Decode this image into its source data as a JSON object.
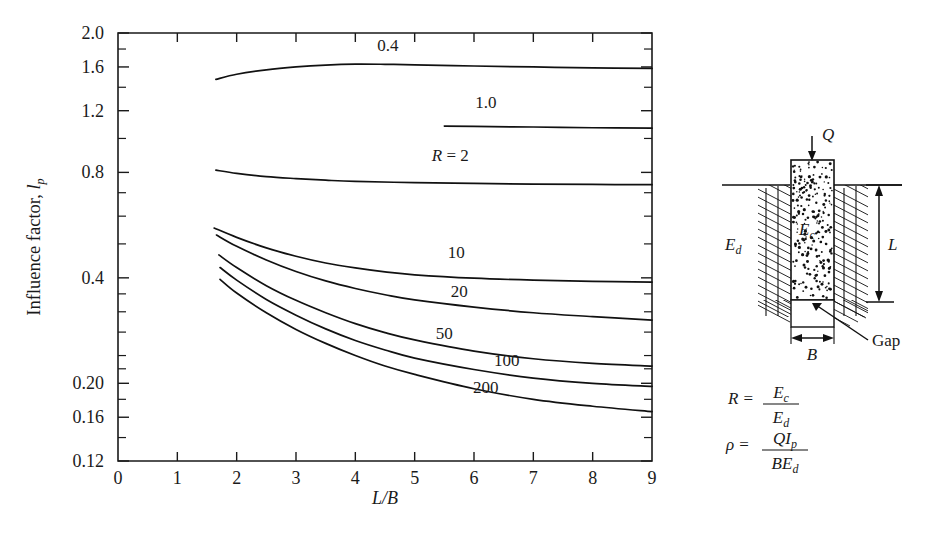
{
  "chart_data": {
    "type": "line",
    "title": "",
    "xlabel": "L/B",
    "ylabel": "Influence factor, Ip",
    "yscale": "log",
    "xlim": [
      0,
      9
    ],
    "ylim": [
      0.12,
      2.0
    ],
    "grid": false,
    "legend_position": "inline-curve-labels",
    "xticks": [
      "0",
      "1",
      "2",
      "3",
      "4",
      "5",
      "6",
      "7",
      "8",
      "9"
    ],
    "xtick_values": [
      0,
      1,
      2,
      3,
      4,
      5,
      6,
      7,
      8,
      9
    ],
    "yticks": [
      "2.0",
      "1.6",
      "1.2",
      "0.8",
      "0.4",
      "0.20",
      "0.16",
      "0.12"
    ],
    "ytick_values": [
      2.0,
      1.6,
      1.2,
      0.8,
      0.4,
      0.2,
      0.16,
      0.12
    ],
    "yticks_minor": [
      1.8,
      1.4,
      1.0,
      0.7,
      0.6,
      0.5,
      0.36,
      0.32,
      0.28,
      0.24,
      0.22,
      0.18,
      0.14
    ],
    "series": [
      {
        "name": "0.4",
        "label": "0.4",
        "label_x": 4.55,
        "label_y": 1.78,
        "points": [
          [
            1.65,
            1.475
          ],
          [
            2.0,
            1.525
          ],
          [
            2.5,
            1.57
          ],
          [
            3.0,
            1.6
          ],
          [
            3.5,
            1.62
          ],
          [
            4.0,
            1.63
          ],
          [
            4.5,
            1.628
          ],
          [
            5.0,
            1.622
          ],
          [
            6.0,
            1.61
          ],
          [
            7.0,
            1.6
          ],
          [
            8.0,
            1.59
          ],
          [
            9.0,
            1.585
          ]
        ]
      },
      {
        "name": "1.0",
        "label": "1.0",
        "label_x": 6.2,
        "label_y": 1.22,
        "points": [
          [
            5.5,
            1.085
          ],
          [
            6.0,
            1.082
          ],
          [
            7.0,
            1.078
          ],
          [
            8.0,
            1.073
          ],
          [
            9.0,
            1.07
          ]
        ]
      },
      {
        "name": "R = 2",
        "label": "R = 2",
        "label_x": 5.6,
        "label_y": 0.86,
        "points": [
          [
            1.65,
            0.812
          ],
          [
            2.0,
            0.795
          ],
          [
            2.5,
            0.778
          ],
          [
            3.0,
            0.768
          ],
          [
            3.5,
            0.76
          ],
          [
            4.0,
            0.754
          ],
          [
            5.0,
            0.748
          ],
          [
            6.0,
            0.744
          ],
          [
            7.0,
            0.741
          ],
          [
            8.0,
            0.739
          ],
          [
            9.0,
            0.738
          ]
        ]
      },
      {
        "name": "10",
        "label": "10",
        "label_x": 5.7,
        "label_y": 0.455,
        "points": [
          [
            1.62,
            0.555
          ],
          [
            2.0,
            0.522
          ],
          [
            2.5,
            0.487
          ],
          [
            3.0,
            0.461
          ],
          [
            3.5,
            0.441
          ],
          [
            4.0,
            0.427
          ],
          [
            4.5,
            0.416
          ],
          [
            5.0,
            0.408
          ],
          [
            6.0,
            0.399
          ],
          [
            7.0,
            0.394
          ],
          [
            8.0,
            0.391
          ],
          [
            9.0,
            0.389
          ]
        ]
      },
      {
        "name": "20",
        "label": "20",
        "label_x": 5.75,
        "label_y": 0.352,
        "points": [
          [
            1.66,
            0.53
          ],
          [
            2.0,
            0.492
          ],
          [
            2.5,
            0.45
          ],
          [
            3.0,
            0.417
          ],
          [
            3.5,
            0.392
          ],
          [
            4.0,
            0.373
          ],
          [
            4.5,
            0.358
          ],
          [
            5.0,
            0.346
          ],
          [
            6.0,
            0.33
          ],
          [
            7.0,
            0.318
          ],
          [
            8.0,
            0.31
          ],
          [
            9.0,
            0.303
          ]
        ]
      },
      {
        "name": "50",
        "label": "50",
        "label_x": 5.5,
        "label_y": 0.268,
        "points": [
          [
            1.7,
            0.465
          ],
          [
            2.0,
            0.428
          ],
          [
            2.5,
            0.38
          ],
          [
            3.0,
            0.345
          ],
          [
            3.5,
            0.318
          ],
          [
            4.0,
            0.296
          ],
          [
            4.5,
            0.279
          ],
          [
            5.0,
            0.266
          ],
          [
            6.0,
            0.247
          ],
          [
            7.0,
            0.235
          ],
          [
            8.0,
            0.228
          ],
          [
            9.0,
            0.224
          ]
        ]
      },
      {
        "name": "100",
        "label": "100",
        "label_x": 6.55,
        "label_y": 0.224,
        "points": [
          [
            1.72,
            0.428
          ],
          [
            2.0,
            0.394
          ],
          [
            2.5,
            0.347
          ],
          [
            3.0,
            0.313
          ],
          [
            3.5,
            0.286
          ],
          [
            4.0,
            0.265
          ],
          [
            4.5,
            0.249
          ],
          [
            5.0,
            0.236
          ],
          [
            6.0,
            0.219
          ],
          [
            7.0,
            0.207
          ],
          [
            8.0,
            0.2
          ],
          [
            9.0,
            0.196
          ]
        ]
      },
      {
        "name": "200",
        "label": "200",
        "label_x": 6.2,
        "label_y": 0.188,
        "points": [
          [
            1.72,
            0.396
          ],
          [
            2.0,
            0.362
          ],
          [
            2.5,
            0.318
          ],
          [
            3.0,
            0.285
          ],
          [
            3.5,
            0.26
          ],
          [
            4.0,
            0.24
          ],
          [
            4.5,
            0.224
          ],
          [
            5.0,
            0.212
          ],
          [
            6.0,
            0.193
          ],
          [
            7.0,
            0.18
          ],
          [
            8.0,
            0.172
          ],
          [
            9.0,
            0.166
          ]
        ]
      }
    ]
  },
  "axes": {
    "y_label_main": "Influence factor, ",
    "y_label_symbol": "l",
    "y_label_sub": "p",
    "x_label_num": "L",
    "x_label_slash": "/",
    "x_label_den": "B"
  },
  "diagram": {
    "load_label": "Q",
    "concrete_modulus": "E",
    "concrete_modulus_sub": "c",
    "soil_modulus": "E",
    "soil_modulus_sub": "d",
    "length_label": "L",
    "width_label": "B",
    "gap_label": "Gap"
  },
  "formulas": [
    {
      "name": "modulus-ratio",
      "lhs": "R",
      "eq": "=",
      "numerator": "E",
      "numerator_sub": "c",
      "denominator": "E",
      "denominator_sub": "d"
    },
    {
      "name": "settlement",
      "lhs": "ρ",
      "eq": "=",
      "numerator": "QI",
      "numerator_sub": "p",
      "denominator": "BE",
      "denominator_sub": "d"
    }
  ],
  "colors": {
    "ink": "#1a1a1a",
    "curve": "#111111",
    "background": "#ffffff"
  }
}
